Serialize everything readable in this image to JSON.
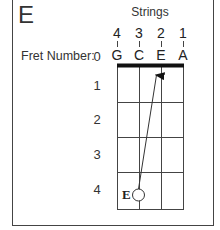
{
  "chord": {
    "name": "E"
  },
  "header": {
    "strings_title": "Strings",
    "fret_number_label": "Fret Number:"
  },
  "strings": [
    {
      "number": "4",
      "note": "G"
    },
    {
      "number": "3",
      "note": "C"
    },
    {
      "number": "2",
      "note": "E"
    },
    {
      "number": "1",
      "note": "A"
    }
  ],
  "frets": [
    "0",
    "1",
    "2",
    "3",
    "4"
  ],
  "marker": {
    "label": "E",
    "string": "3",
    "fret": "4",
    "shape": "open-circle"
  },
  "arrow": {
    "from": "string 3, fret 4",
    "to": "string 2, fret 0"
  },
  "colors": {
    "line": "#444444",
    "nut": "#111111",
    "text": "#333333"
  }
}
